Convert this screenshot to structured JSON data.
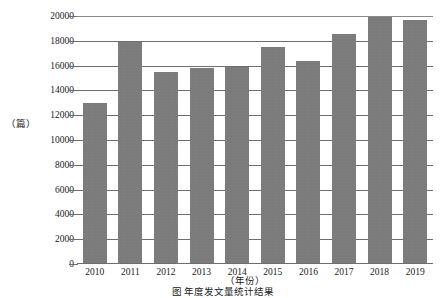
{
  "chart_data": {
    "type": "bar",
    "title": "",
    "subtitle": "",
    "xlabel": "（年份）",
    "ylabel": "（篇）",
    "categories": [
      "2010",
      "2011",
      "2012",
      "2013",
      "2014",
      "2015",
      "2016",
      "2017",
      "2018",
      "2019"
    ],
    "values": [
      12900,
      17800,
      15400,
      15700,
      15800,
      17400,
      16300,
      18500,
      19800,
      19600
    ],
    "series": [
      {
        "name": "年度发文量",
        "values": [
          12900,
          17800,
          15400,
          15700,
          15800,
          17400,
          16300,
          18500,
          19800,
          19600
        ]
      }
    ],
    "ylim": [
      0,
      20000
    ],
    "ytick_labels": [
      "20000",
      "18000",
      "16000",
      "14000",
      "12000",
      "10000",
      "8000",
      "6000",
      "4000",
      "2000",
      "0"
    ],
    "ytick_values": [
      20000,
      18000,
      16000,
      14000,
      12000,
      10000,
      8000,
      6000,
      4000,
      2000,
      0
    ],
    "ytick_interval": 2000,
    "grid": true,
    "grid_axis": "y",
    "legend": false,
    "legend_position": "none",
    "bar_color": "#7b7b7b",
    "axis_color": "#6e6e6e",
    "background_color": "#ffffff",
    "annotations": []
  },
  "axes": {
    "y_unit": "（篇）",
    "x_title": "（年份）"
  },
  "caption": {
    "text": "图  年度发文量统计结果"
  }
}
